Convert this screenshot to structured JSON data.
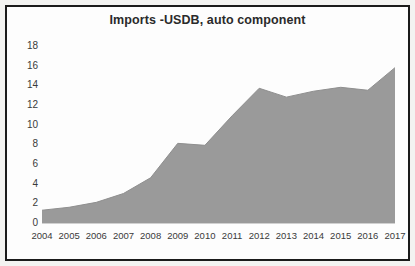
{
  "figure": {
    "border_color": "#1b1b1b",
    "background_color": "#fdfdfd",
    "outer_background_color": "#f3f3f1"
  },
  "chart_data": {
    "type": "area",
    "title": "Imports -USDB, auto component",
    "xlabel": "",
    "ylabel": "",
    "categories": [
      "2004",
      "2005",
      "2006",
      "2007",
      "2008",
      "2009",
      "2010",
      "2011",
      "2012",
      "2013",
      "2014",
      "2015",
      "2016",
      "2017"
    ],
    "values": [
      1.3,
      1.6,
      2.1,
      3.0,
      4.6,
      8.1,
      7.9,
      10.9,
      13.7,
      12.8,
      13.4,
      13.8,
      13.5,
      15.8
    ],
    "series": [
      {
        "name": "Imports -USDB, auto component",
        "values": [
          1.3,
          1.6,
          2.1,
          3.0,
          4.6,
          8.1,
          7.9,
          10.9,
          13.7,
          12.8,
          13.4,
          13.8,
          13.5,
          15.8
        ]
      }
    ],
    "ylim": [
      0,
      18
    ],
    "yticks": [
      0,
      2,
      4,
      6,
      8,
      10,
      12,
      14,
      16,
      18
    ],
    "ytick_labels": [
      "0",
      "2",
      "4",
      "6",
      "8",
      "10",
      "12",
      "14",
      "16",
      "18"
    ],
    "grid": false,
    "legend": false,
    "legend_position": "none",
    "area_fill_color": "#9a9a9a",
    "area_line_color": "#8f8f8f"
  }
}
